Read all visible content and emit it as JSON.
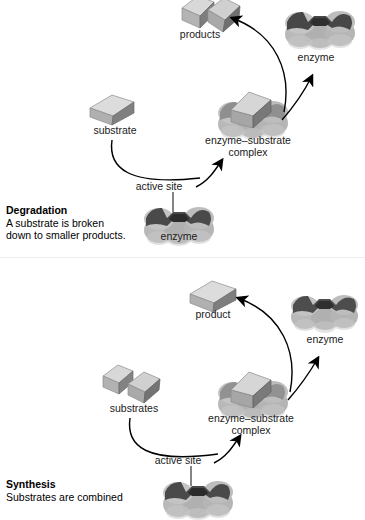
{
  "diagram": {
    "title_absent": true,
    "panels": [
      {
        "id": "degradation",
        "caption_heading": "Degradation",
        "caption_body_line1": "A substrate is broken",
        "caption_body_line2": "down to smaller products.",
        "labels": {
          "products": "products",
          "enzyme_top": "enzyme",
          "substrate": "substrate",
          "complex_line1": "enzyme–substrate",
          "complex_line2": "complex",
          "active_site": "active site",
          "enzyme_bottom": "enzyme"
        },
        "shapes": {
          "products_count": 2,
          "substrate_count": 1,
          "enzyme_lobes": 3
        }
      },
      {
        "id": "synthesis",
        "caption_heading": "Synthesis",
        "caption_body_line1": "Substrates  are combined",
        "caption_body_line2": "",
        "labels": {
          "product": "product",
          "enzyme_top": "enzyme",
          "substrates": "substrates",
          "complex_line1": "enzyme–substrate",
          "complex_line2": "complex",
          "active_site": "active site",
          "enzyme_bottom": ""
        },
        "shapes": {
          "products_count": 1,
          "substrate_count": 2,
          "enzyme_lobes": 3
        }
      }
    ],
    "colors": {
      "background": "#ffffff",
      "text": "#111111",
      "arrow": "#000000",
      "enzyme_light": "#cfcfcf",
      "enzyme_mid": "#9a9a9a",
      "enzyme_dark": "#4a4a4a",
      "block_light": "#dcdcdc",
      "block_mid": "#a8a8a8",
      "block_dark": "#6e6e6e",
      "divider": "#ededed"
    }
  }
}
